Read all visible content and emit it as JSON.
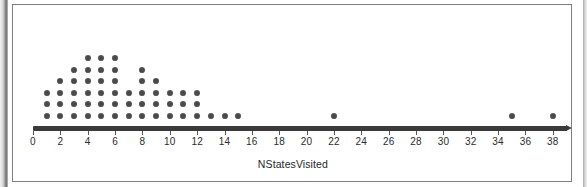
{
  "chart_data": {
    "type": "scatter",
    "plot_style": "dotplot",
    "title": "",
    "subtitle": "",
    "xlabel": "NStatesVisited",
    "ylabel": "",
    "grid": false,
    "legend": null,
    "xlim": [
      0,
      39
    ],
    "xticks": [
      0,
      2,
      4,
      6,
      8,
      10,
      12,
      14,
      16,
      18,
      20,
      22,
      24,
      26,
      28,
      30,
      32,
      34,
      36,
      38
    ],
    "xtick_labels": [
      "0",
      "2",
      "4",
      "6",
      "8",
      "10",
      "12",
      "14",
      "16",
      "18",
      "20",
      "22",
      "24",
      "26",
      "28",
      "30",
      "32",
      "34",
      "36",
      "38"
    ],
    "xtick_step": 2,
    "dot_color": "#4a4a4a",
    "axis_color": "#3a3a3a",
    "categories": [
      1,
      2,
      3,
      4,
      5,
      6,
      7,
      8,
      9,
      10,
      11,
      12,
      13,
      14,
      15,
      22,
      35,
      38
    ],
    "values": [
      3,
      4,
      5,
      6,
      6,
      6,
      3,
      5,
      4,
      3,
      3,
      3,
      1,
      1,
      1,
      1,
      1,
      1
    ],
    "points": [
      {
        "x": 1,
        "count": 3
      },
      {
        "x": 2,
        "count": 4
      },
      {
        "x": 3,
        "count": 5
      },
      {
        "x": 4,
        "count": 6
      },
      {
        "x": 5,
        "count": 6
      },
      {
        "x": 6,
        "count": 6
      },
      {
        "x": 7,
        "count": 3
      },
      {
        "x": 8,
        "count": 5
      },
      {
        "x": 9,
        "count": 4
      },
      {
        "x": 10,
        "count": 3
      },
      {
        "x": 11,
        "count": 3
      },
      {
        "x": 12,
        "count": 3
      },
      {
        "x": 13,
        "count": 1
      },
      {
        "x": 14,
        "count": 1
      },
      {
        "x": 15,
        "count": 1
      },
      {
        "x": 22,
        "count": 1
      },
      {
        "x": 35,
        "count": 1
      },
      {
        "x": 38,
        "count": 1
      }
    ],
    "total_observations": 52
  }
}
